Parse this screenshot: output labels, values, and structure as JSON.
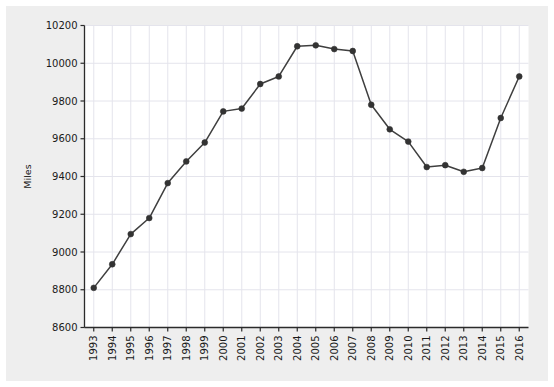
{
  "chart_data": {
    "type": "line",
    "title": "",
    "xlabel": "",
    "ylabel": "Miles",
    "x": [
      "1993",
      "1994",
      "1995",
      "1996",
      "1997",
      "1998",
      "1999",
      "2000",
      "2001",
      "2002",
      "2003",
      "2004",
      "2005",
      "2006",
      "2007",
      "2008",
      "2009",
      "2010",
      "2011",
      "2012",
      "2013",
      "2014",
      "2015",
      "2016"
    ],
    "categories": [
      "1993",
      "1994",
      "1995",
      "1996",
      "1997",
      "1998",
      "1999",
      "2000",
      "2001",
      "2002",
      "2003",
      "2004",
      "2005",
      "2006",
      "2007",
      "2008",
      "2009",
      "2010",
      "2011",
      "2012",
      "2013",
      "2014",
      "2015",
      "2016"
    ],
    "values": [
      8810,
      8935,
      9095,
      9180,
      9365,
      9480,
      9580,
      9745,
      9760,
      9890,
      9930,
      10090,
      10095,
      10075,
      10065,
      9780,
      9650,
      9585,
      9450,
      9460,
      9425,
      9445,
      9710,
      9930
    ],
    "series": [
      {
        "name": "Miles",
        "values": [
          8810,
          8935,
          9095,
          9180,
          9365,
          9480,
          9580,
          9745,
          9760,
          9890,
          9930,
          10090,
          10095,
          10075,
          10065,
          9780,
          9650,
          9585,
          9450,
          9460,
          9425,
          9445,
          9710,
          9930
        ]
      }
    ],
    "ylim": [
      8600,
      10200
    ],
    "yticks": [
      8600,
      8800,
      9000,
      9200,
      9400,
      9600,
      9800,
      10000,
      10200
    ],
    "ytick_labels": [
      "8600",
      "8800",
      "9000",
      "9200",
      "9400",
      "9600",
      "9800",
      "10000",
      "10200"
    ],
    "grid": true,
    "legend": false,
    "legend_position": "none",
    "line_color": "#3f3f3f",
    "marker_color": "#333333",
    "marker": "circle",
    "plot_background": "#ffffff",
    "figure_background": "#eeeeee",
    "gridline_color": "#e4e4ec"
  }
}
